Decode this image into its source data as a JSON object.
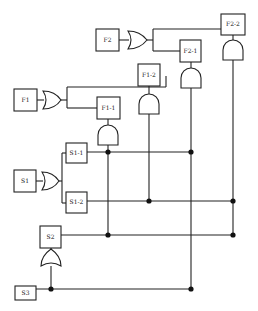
{
  "diagram": {
    "type": "logic fault-tree / gate network",
    "blocks": {
      "F2": "F2",
      "F2_1": "F2-1",
      "F2_2": "F2-2",
      "F1": "F1",
      "F1_1": "F1-1",
      "F1_2": "F1-2",
      "S1_1": "S1-1",
      "S1": "S1",
      "S1_2": "S1-2",
      "S2": "S2",
      "S3": "S3"
    },
    "gates": [
      {
        "id": "or-f2",
        "type": "OR",
        "inputs_from": "F2",
        "outputs_to": [
          "F2-1",
          "F2-2"
        ]
      },
      {
        "id": "or-f1",
        "type": "OR",
        "inputs_from": "F1",
        "outputs_to": [
          "F1-1",
          "F1-2"
        ]
      },
      {
        "id": "or-s1",
        "type": "OR",
        "inputs_from": "S1",
        "outputs_to": [
          "S1-1",
          "S1-2"
        ]
      },
      {
        "id": "or-s2",
        "type": "OR",
        "inputs_from": "S3",
        "outputs_to": [
          "S2"
        ]
      },
      {
        "id": "and-f2-2",
        "type": "AND",
        "block": "F2-2"
      },
      {
        "id": "and-f2-1",
        "type": "AND",
        "block": "F2-1"
      },
      {
        "id": "and-f1-2",
        "type": "AND",
        "block": "F1-2"
      },
      {
        "id": "and-f1-1",
        "type": "AND",
        "block": "F1-1"
      }
    ],
    "colors": {
      "line": "#222222",
      "background": "#ffffff"
    }
  }
}
